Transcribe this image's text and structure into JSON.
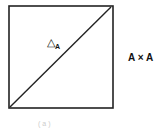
{
  "diagram": {
    "square_label": "A × A",
    "diagonal_label_symbol": "△",
    "diagonal_label_subscript": "A",
    "caption": "(a)",
    "colors": {
      "stroke": "#222222",
      "background": "#ffffff"
    }
  }
}
